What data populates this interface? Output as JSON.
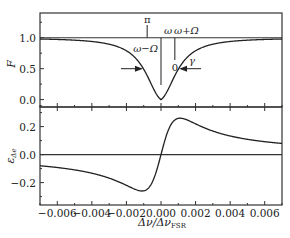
{
  "chart_data": [
    {
      "type": "line",
      "panel": "top",
      "ylabel": "F",
      "xlabel": "",
      "xlim": [
        -0.007,
        0.007
      ],
      "ylim": [
        -0.12,
        1.4
      ],
      "yticks": [
        0.0,
        0.5,
        1.0
      ],
      "ytick_labels": [
        "0.0",
        "0.5",
        "1.0"
      ],
      "grid": false,
      "series": [
        {
          "name": "F (Lorentzian dip)",
          "model": "lorentzian_dip",
          "center": 0.0,
          "half_width": 0.0011,
          "baseline": 1.0,
          "min": 0.0
        },
        {
          "name": "reference line",
          "model": "constant",
          "value": 1.0
        }
      ],
      "annotations": {
        "pi_label": "π",
        "omega_label": "ω",
        "omega_plus_label": "ω+Ω",
        "omega_minus_label": "ω−Ω",
        "zero_label": "0",
        "gamma_label": "γ",
        "sideband_markers_x": [
          -0.0008,
          0.0,
          0.0008
        ],
        "gamma_arrow_level": 0.5
      }
    },
    {
      "type": "line",
      "panel": "bottom",
      "ylabel": "ε_Δe",
      "xlabel": "Δν/Δν_FSR",
      "xlim": [
        -0.007,
        0.007
      ],
      "ylim": [
        -0.36,
        0.34
      ],
      "xticks": [
        -0.006,
        -0.004,
        -0.002,
        0.0,
        0.002,
        0.004,
        0.006
      ],
      "xtick_labels": [
        "−0.006",
        "−0.004",
        "−0.002",
        "0.000",
        "0.002",
        "0.004",
        "0.006"
      ],
      "yticks": [
        -0.2,
        0.0,
        0.2
      ],
      "ytick_labels": [
        "−0.2",
        "0.0",
        "0.2"
      ],
      "grid": false,
      "series": [
        {
          "name": "error signal (dispersive)",
          "model": "dispersive",
          "center": 0.0,
          "half_width": 0.0011,
          "peak": 0.26,
          "trough": -0.26,
          "peak_x": 0.0011,
          "trough_x": -0.0011
        },
        {
          "name": "zero line",
          "model": "constant",
          "value": 0.0
        }
      ]
    }
  ]
}
